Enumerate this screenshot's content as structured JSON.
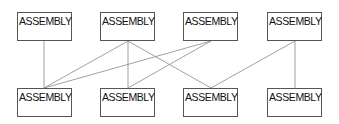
{
  "diagram": {
    "top_nodes": [
      {
        "label": "ASSEMBLY"
      },
      {
        "label": "ASSEMBLY"
      },
      {
        "label": "ASSEMBLY"
      },
      {
        "label": "ASSEMBLY"
      }
    ],
    "bottom_nodes": [
      {
        "label": "ASSEMBLY"
      },
      {
        "label": "ASSEMBLY"
      },
      {
        "label": "ASSEMBLY"
      },
      {
        "label": "ASSEMBLY"
      }
    ],
    "edges": [
      {
        "from": "top-1",
        "to": "bottom-1"
      },
      {
        "from": "top-2",
        "to": "bottom-1"
      },
      {
        "from": "top-2",
        "to": "bottom-2"
      },
      {
        "from": "top-2",
        "to": "bottom-3"
      },
      {
        "from": "top-3",
        "to": "bottom-1"
      },
      {
        "from": "top-3",
        "to": "bottom-2"
      },
      {
        "from": "top-4",
        "to": "bottom-3"
      },
      {
        "from": "top-4",
        "to": "bottom-4"
      }
    ]
  }
}
